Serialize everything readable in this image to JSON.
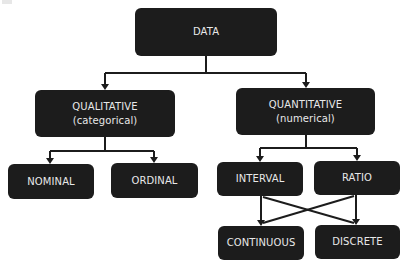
{
  "diagram": {
    "type": "tree",
    "nodes": {
      "data": {
        "label": "DATA"
      },
      "qualitative": {
        "label": "QUALITATIVE",
        "sublabel": "(categorical)"
      },
      "quantitative": {
        "label": "QUANTITATIVE",
        "sublabel": "(numerical)"
      },
      "nominal": {
        "label": "NOMINAL"
      },
      "ordinal": {
        "label": "ORDINAL"
      },
      "interval": {
        "label": "INTERVAL"
      },
      "ratio": {
        "label": "RATIO"
      },
      "continuous": {
        "label": "CONTINUOUS"
      },
      "discrete": {
        "label": "DISCRETE"
      }
    },
    "edges": [
      [
        "DATA",
        "QUALITATIVE"
      ],
      [
        "DATA",
        "QUANTITATIVE"
      ],
      [
        "QUALITATIVE",
        "NOMINAL"
      ],
      [
        "QUALITATIVE",
        "ORDINAL"
      ],
      [
        "QUANTITATIVE",
        "INTERVAL"
      ],
      [
        "QUANTITATIVE",
        "RATIO"
      ],
      [
        "INTERVAL",
        "CONTINUOUS"
      ],
      [
        "INTERVAL",
        "DISCRETE"
      ],
      [
        "RATIO",
        "CONTINUOUS"
      ],
      [
        "RATIO",
        "DISCRETE"
      ]
    ],
    "colors": {
      "node_fill": "#1c1c1c",
      "node_text": "#e8e8e8",
      "edge": "#1c1c1c",
      "background": "#ffffff"
    }
  }
}
